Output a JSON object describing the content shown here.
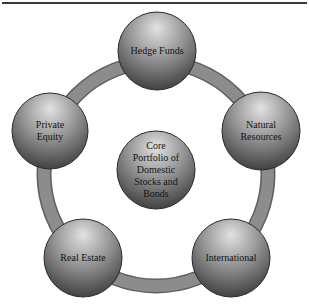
{
  "diagram": {
    "type": "hub-and-ring",
    "colors": {
      "ring_fill": "#8c8c8c",
      "ring_edge": "#5e5e5e",
      "sphere_highlight": "#e2e2e2",
      "sphere_mid": "#9a9a9a",
      "sphere_shadow": "#3c3c3c",
      "sphere_outline": "#2a2a2a",
      "text": "#141414",
      "top_rule": "#3a3a3a"
    },
    "center": {
      "label": "Core\nPortfolio of\nDomestic\nStocks and\nBonds"
    },
    "nodes": [
      {
        "id": "hedge-funds",
        "label": "Hedge Funds"
      },
      {
        "id": "natural-resources",
        "label": "Natural\nResources"
      },
      {
        "id": "international",
        "label": "International"
      },
      {
        "id": "real-estate",
        "label": "Real Estate"
      },
      {
        "id": "private-equity",
        "label": "Private\nEquity"
      }
    ]
  }
}
